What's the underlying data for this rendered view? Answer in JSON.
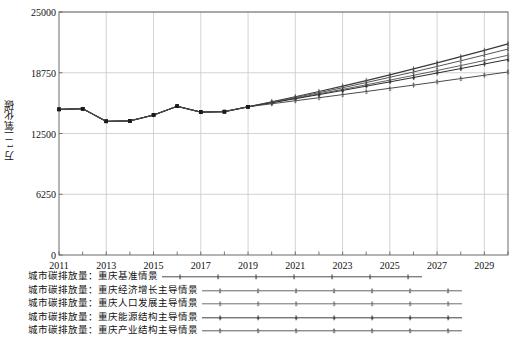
{
  "chart_data": {
    "type": "line",
    "title": "",
    "xlabel": "",
    "ylabel": "万 t 二氧化碳",
    "xlim": [
      2011,
      2030
    ],
    "ylim": [
      0,
      25000
    ],
    "yticks": [
      0,
      6250,
      12500,
      18750,
      25000
    ],
    "ytick_labels": [
      "0",
      "6250",
      "12500",
      "18750",
      "25000"
    ],
    "xticks": [
      2011,
      2012,
      2013,
      2014,
      2015,
      2016,
      2017,
      2018,
      2019,
      2020,
      2021,
      2022,
      2023,
      2024,
      2025,
      2026,
      2027,
      2028,
      2029,
      2030
    ],
    "xtick_labels_shown": [
      "2011",
      "2013",
      "2015",
      "2017",
      "2019",
      "2021",
      "2023",
      "2025",
      "2027",
      "2029"
    ],
    "grid": true,
    "legend_position": "bottom-left",
    "x": [
      2011,
      2012,
      2013,
      2014,
      2015,
      2016,
      2017,
      2018,
      2019,
      2020,
      2021,
      2022,
      2023,
      2024,
      2025,
      2026,
      2027,
      2028,
      2029,
      2030
    ],
    "series": [
      {
        "name": "城市碳排放量：重庆基准情景",
        "marker": "1",
        "color": "#3a3a3a",
        "values": [
          14980,
          15050,
          13750,
          13800,
          14400,
          15300,
          14700,
          14750,
          15250,
          15750,
          16280,
          16820,
          17380,
          17950,
          18540,
          19140,
          19760,
          20400,
          21050,
          21720
        ]
      },
      {
        "name": "城市碳排放量：重庆经济增长主导情景",
        "marker": "2",
        "color": "#555555",
        "values": [
          14980,
          15050,
          13750,
          13800,
          14400,
          15300,
          14700,
          14750,
          15250,
          15720,
          16200,
          16700,
          17210,
          17740,
          18280,
          18830,
          19400,
          19980,
          20580,
          21190
        ]
      },
      {
        "name": "城市碳排放量：重庆人口发展主导情景",
        "marker": "3",
        "color": "#606060",
        "values": [
          14980,
          15050,
          13750,
          13800,
          14400,
          15300,
          14700,
          14750,
          15250,
          15690,
          16130,
          16580,
          17040,
          17510,
          17990,
          18480,
          18980,
          19490,
          20010,
          20550
        ]
      },
      {
        "name": "城市碳排放量：重庆能源结构主导情景",
        "marker": "4",
        "color": "#2b2b2b",
        "values": [
          14980,
          15050,
          13750,
          13800,
          14400,
          15300,
          14700,
          14750,
          15250,
          15660,
          16080,
          16500,
          16930,
          17370,
          17810,
          18260,
          18720,
          19180,
          19650,
          20120
        ]
      },
      {
        "name": "城市碳排放量：重庆产业结构主导情景",
        "marker": "5",
        "color": "#4a4a4a",
        "values": [
          14980,
          15050,
          13750,
          13800,
          14400,
          15300,
          14700,
          14750,
          15250,
          15560,
          15870,
          16180,
          16500,
          16820,
          17150,
          17480,
          17810,
          18150,
          18490,
          18830
        ]
      }
    ]
  },
  "axes": {
    "ylabel": "万 t 二氧化碳"
  },
  "legend": {
    "items": [
      {
        "label": "城市碳排放量：重庆基准情景",
        "marker": "1"
      },
      {
        "label": "城市碳排放量：重庆经济增长主导情景",
        "marker": "2"
      },
      {
        "label": "城市碳排放量：重庆人口发展主导情景",
        "marker": "3"
      },
      {
        "label": "城市碳排放量：重庆能源结构主导情景",
        "marker": "4"
      },
      {
        "label": "城市碳排放量：重庆产业结构主导情景",
        "marker": "5"
      }
    ]
  }
}
